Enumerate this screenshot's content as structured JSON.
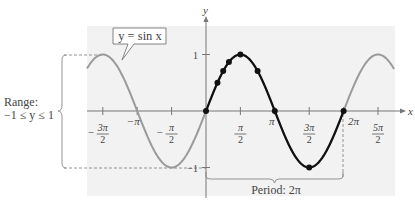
{
  "chart_data": {
    "type": "line",
    "title": "",
    "function": "y = sin x",
    "xlabel": "x",
    "ylabel": "y",
    "xlim": [
      -4.2,
      5.4
    ],
    "ylim": [
      -1.5,
      1.5
    ],
    "x_ticks": [
      {
        "value": -4.712,
        "num": "3π",
        "den": "2",
        "neg": true
      },
      {
        "value": -3.1416,
        "text": "−π"
      },
      {
        "value": -1.5708,
        "num": "π",
        "den": "2",
        "neg": true
      },
      {
        "value": 1.5708,
        "num": "π",
        "den": "2",
        "neg": false
      },
      {
        "value": 3.1416,
        "text": "π"
      },
      {
        "value": 4.712,
        "num": "3π",
        "den": "2",
        "neg": false
      },
      {
        "value": 6.2832,
        "text": "2π"
      },
      {
        "value": 7.854,
        "num": "5π",
        "den": "2",
        "neg": false
      }
    ],
    "y_ticks": [
      {
        "value": 1,
        "text": "1"
      },
      {
        "value": -1,
        "text": "−1"
      }
    ],
    "series": [
      {
        "name": "sin x (full)",
        "color": "#9a9a9a",
        "x_range": [
          -5.8,
          8.7
        ]
      },
      {
        "name": "sin x (one period)",
        "color": "#111111",
        "x_range": [
          0,
          6.2832
        ]
      }
    ],
    "key_points": [
      {
        "x": 0,
        "y": 0
      },
      {
        "x": 0.5236,
        "y": 0.5
      },
      {
        "x": 0.7854,
        "y": 0.7071
      },
      {
        "x": 1.0472,
        "y": 0.866
      },
      {
        "x": 1.5708,
        "y": 1
      },
      {
        "x": 2.3562,
        "y": 0.7071
      },
      {
        "x": 3.1416,
        "y": 0
      },
      {
        "x": 4.7124,
        "y": -1
      },
      {
        "x": 6.2832,
        "y": 0
      }
    ],
    "annotations": [
      {
        "text": "y = sin x",
        "type": "callout"
      },
      {
        "text": "Range:",
        "type": "brace-label"
      },
      {
        "text": "−1 ≤ y ≤ 1",
        "type": "brace-label"
      },
      {
        "text": "Period: 2π",
        "type": "brace-label"
      }
    ]
  },
  "labels": {
    "callout": "y = sin x",
    "range_line1": "Range:",
    "range_line2": "−1 ≤ y ≤ 1",
    "period": "Period: 2π",
    "x_axis": "x",
    "y_axis": "y",
    "y_tick_pos": "1",
    "y_tick_neg": "−1"
  },
  "colors": {
    "background_panel": "#f2f2f2",
    "full_curve": "#9a9a9a",
    "period_curve": "#111111",
    "axes": "#777777"
  }
}
